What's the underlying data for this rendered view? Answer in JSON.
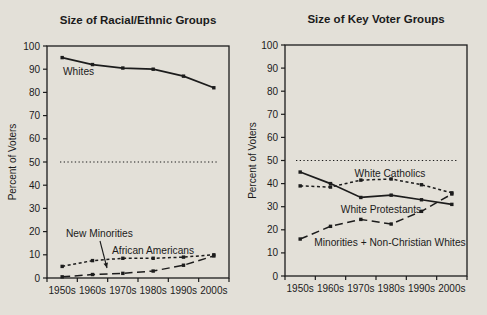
{
  "figure": {
    "background_color": "#e3e0d8",
    "ink_color": "#1c1c1c"
  },
  "chart_data": [
    {
      "type": "line",
      "title": "Size of Racial/Ethnic Groups",
      "xlabel": "",
      "ylabel": "Percent of Voters",
      "categories": [
        "1950s",
        "1960s",
        "1970s",
        "1980s",
        "1990s",
        "2000s"
      ],
      "ylim": [
        0,
        100
      ],
      "ytick_step": 10,
      "grid": false,
      "legend": "inline-labels",
      "reference_line": {
        "value": 50,
        "style": "dotted"
      },
      "series": [
        {
          "name": "Whites",
          "style": "solid",
          "values": [
            95,
            92,
            90.5,
            90,
            87,
            82
          ]
        },
        {
          "name": "African Americans",
          "style": "short-dash",
          "values": [
            5,
            7.5,
            8.5,
            8.5,
            9,
            10
          ]
        },
        {
          "name": "New Minorities",
          "style": "long-dash",
          "values": [
            0.5,
            1.5,
            2,
            3,
            5.5,
            9.5
          ]
        }
      ],
      "annotations": [
        {
          "text": "Whites",
          "series": "Whites",
          "arrow": false
        },
        {
          "text": "New Minorities",
          "series": "New Minorities",
          "arrow": true
        },
        {
          "text": "African Americans",
          "series": "African Americans",
          "arrow": false
        }
      ]
    },
    {
      "type": "line",
      "title": "Size of Key Voter Groups",
      "xlabel": "",
      "ylabel": "Percent of Voters",
      "categories": [
        "1950s",
        "1960s",
        "1970s",
        "1980s",
        "1990s",
        "2000s"
      ],
      "ylim": [
        0,
        100
      ],
      "ytick_step": 10,
      "grid": false,
      "legend": "inline-labels",
      "reference_line": {
        "value": 50,
        "style": "dotted"
      },
      "series": [
        {
          "name": "White Catholics",
          "style": "short-dash",
          "values": [
            39,
            38.5,
            41.5,
            42,
            39.5,
            36
          ]
        },
        {
          "name": "White Protestants",
          "style": "solid",
          "values": [
            45,
            40,
            34,
            35,
            33,
            31
          ]
        },
        {
          "name": "Minorities + Non-Christian Whites",
          "style": "long-dash",
          "values": [
            16,
            21.5,
            24.5,
            22.5,
            28,
            35.5
          ]
        }
      ],
      "annotations": [
        {
          "text": "White Catholics",
          "series": "White Catholics",
          "arrow": false
        },
        {
          "text": "White Protestants",
          "series": "White Protestants",
          "arrow": false
        },
        {
          "text": "Minorities + Non-Christian Whites",
          "series": "Minorities + Non-Christian Whites",
          "arrow": false
        }
      ]
    }
  ]
}
